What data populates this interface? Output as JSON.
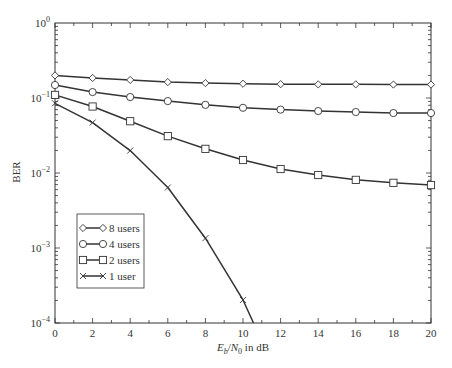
{
  "chart_data": {
    "type": "line",
    "title": "",
    "xlabel": "E_b/N_0 in dB",
    "xlabel_parts": {
      "E": "E",
      "b": "b",
      "slash": "/",
      "N": "N",
      "zero": "0",
      "suffix": " in dB"
    },
    "ylabel": "BER",
    "xlim": [
      0,
      20
    ],
    "ylim": [
      0.0001,
      1
    ],
    "yscale": "log",
    "grid": false,
    "legend_position": "lower left",
    "x_ticks": [
      0,
      2,
      4,
      6,
      8,
      10,
      12,
      14,
      16,
      18,
      20
    ],
    "y_ticks": [
      {
        "value": 1,
        "base": "10",
        "exp": "0"
      },
      {
        "value": 0.1,
        "base": "10",
        "exp": "−1"
      },
      {
        "value": 0.01,
        "base": "10",
        "exp": "−2"
      },
      {
        "value": 0.001,
        "base": "10",
        "exp": "−3"
      },
      {
        "value": 0.0001,
        "base": "10",
        "exp": "−4"
      }
    ],
    "x": [
      0,
      2,
      4,
      6,
      8,
      10,
      12,
      14,
      16,
      18,
      20
    ],
    "series": [
      {
        "name": "8 users",
        "marker": "diamond",
        "values": [
          0.2,
          0.185,
          0.174,
          0.163,
          0.158,
          0.155,
          0.153,
          0.152,
          0.152,
          0.151,
          0.151
        ]
      },
      {
        "name": "4 users",
        "marker": "circle",
        "values": [
          0.149,
          0.12,
          0.103,
          0.091,
          0.081,
          0.074,
          0.07,
          0.067,
          0.065,
          0.063,
          0.063
        ]
      },
      {
        "name": "2 users",
        "marker": "square",
        "values": [
          0.11,
          0.077,
          0.049,
          0.031,
          0.021,
          0.0149,
          0.0113,
          0.0094,
          0.0081,
          0.0074,
          0.0069
        ]
      },
      {
        "name": "1 user",
        "marker": "x",
        "values": [
          0.085,
          0.047,
          0.0199,
          0.0064,
          0.00135,
          0.000203,
          null,
          null,
          null,
          null,
          null
        ],
        "extends_to": {
          "x": 10.56,
          "y": 0.0001
        }
      }
    ]
  },
  "colors": {
    "line": "#333333",
    "axis": "#333333",
    "background": "#ffffff"
  }
}
